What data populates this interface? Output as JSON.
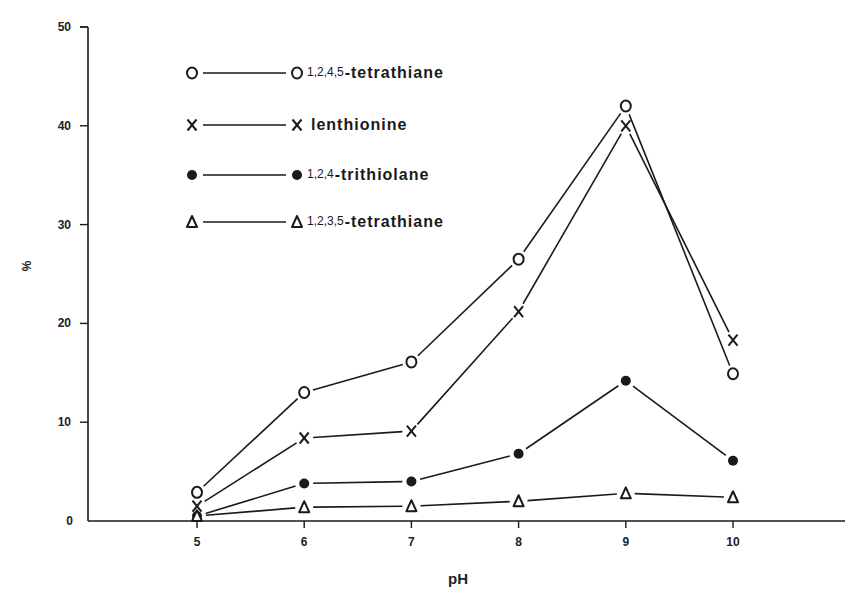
{
  "chart_data": {
    "type": "line",
    "title": "",
    "xlabel": "pH",
    "ylabel": "%",
    "x": [
      5,
      6,
      7,
      8,
      9,
      10
    ],
    "xticks": [
      "5",
      "6",
      "7",
      "8",
      "9",
      "10"
    ],
    "yticks": [
      "0",
      "10",
      "20",
      "30",
      "40",
      "50"
    ],
    "ylim": [
      0,
      50
    ],
    "xlim": [
      4,
      11
    ],
    "grid": false,
    "legend_position": "upper-left",
    "series": [
      {
        "name": "1,2,4,5-tetrathiane",
        "prefix": "1,2,4,5",
        "label": "-tetrathiane",
        "marker": "O",
        "values": [
          2.9,
          13.0,
          16.1,
          26.5,
          42.0,
          14.9
        ]
      },
      {
        "name": "lenthionine",
        "prefix": "",
        "label": "lenthionine",
        "marker": "X",
        "values": [
          1.5,
          8.4,
          9.1,
          21.2,
          40.0,
          18.3
        ]
      },
      {
        "name": "1,2,4-trithiolane",
        "prefix": "1,2,4",
        "label": "-trithiolane",
        "marker": "●",
        "values": [
          0.5,
          3.8,
          4.0,
          6.8,
          14.2,
          6.1
        ]
      },
      {
        "name": "1,2,3,5-tetrathiane",
        "prefix": "1,2,3,5",
        "label": "-tetrathiane",
        "marker": "Δ",
        "values": [
          0.5,
          1.4,
          1.5,
          2.0,
          2.8,
          2.4
        ]
      }
    ]
  },
  "colors": {
    "ink": "#1a1a1a",
    "background": "#ffffff"
  }
}
